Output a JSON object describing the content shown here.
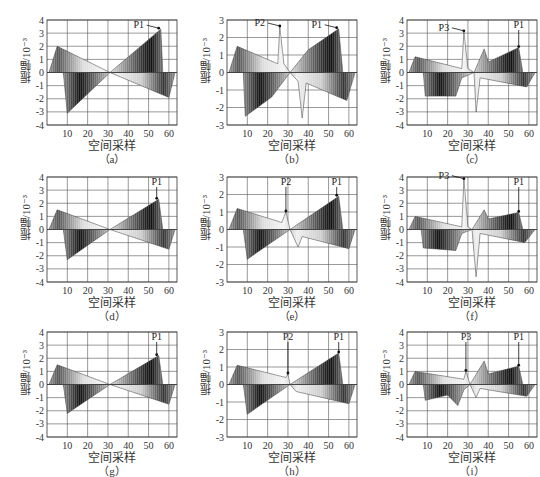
{
  "figure": {
    "ylabel": "振幅/10⁻³",
    "xlabel": "空间采样",
    "x_ticks": [
      10,
      20,
      30,
      40,
      50,
      60
    ]
  },
  "chart_data": [
    {
      "id": "a",
      "type": "area",
      "caption": "（a）",
      "ylim": [
        -4,
        4
      ],
      "y_ticks": [
        4,
        3,
        2,
        1,
        0,
        -1,
        -2,
        -3,
        -4
      ],
      "xlabel": "空间采样",
      "ylabel": "振幅/10⁻³",
      "annotations": [
        {
          "label": "P1",
          "x": 55,
          "y": 3.3
        }
      ],
      "pos_envelope": [
        [
          1,
          0
        ],
        [
          5,
          2.0
        ],
        [
          31,
          0
        ],
        [
          56,
          3.3
        ],
        [
          57,
          0
        ]
      ],
      "neg_envelope": [
        [
          8,
          0
        ],
        [
          10,
          -3.1
        ],
        [
          31,
          0
        ],
        [
          60,
          -1.9
        ],
        [
          63,
          0
        ]
      ]
    },
    {
      "id": "b",
      "type": "area",
      "caption": "（b）",
      "ylim": [
        -3,
        3
      ],
      "y_ticks": [
        3,
        2,
        1,
        0,
        -1,
        -2,
        -3
      ],
      "xlabel": "空间采样",
      "ylabel": "振幅/10⁻³",
      "annotations": [
        {
          "label": "P2",
          "x": 26,
          "y": 2.6
        },
        {
          "label": "P1",
          "x": 54,
          "y": 2.5
        }
      ],
      "pos_envelope": [
        [
          1,
          0
        ],
        [
          5,
          1.5
        ],
        [
          25,
          0.5
        ],
        [
          26,
          2.6
        ],
        [
          28,
          0.5
        ],
        [
          31,
          0
        ],
        [
          40,
          1.3
        ],
        [
          55,
          2.5
        ],
        [
          57,
          0
        ]
      ],
      "neg_envelope": [
        [
          8,
          0
        ],
        [
          9,
          -2.5
        ],
        [
          22,
          -1.4
        ],
        [
          31,
          0
        ],
        [
          35,
          -0.5
        ],
        [
          37,
          -2.6
        ],
        [
          39,
          -0.6
        ],
        [
          59,
          -1.6
        ],
        [
          63,
          0
        ]
      ]
    },
    {
      "id": "c",
      "type": "area",
      "caption": "（c）",
      "ylim": [
        -4,
        4
      ],
      "y_ticks": [
        4,
        3,
        2,
        1,
        0,
        -1,
        -2,
        -3,
        -4
      ],
      "xlabel": "空间采样",
      "ylabel": "振幅/10⁻³",
      "annotations": [
        {
          "label": "P3",
          "x": 28,
          "y": 3.1
        },
        {
          "label": "P1",
          "x": 55,
          "y": 1.9
        }
      ],
      "pos_envelope": [
        [
          1,
          0
        ],
        [
          4,
          1.2
        ],
        [
          27,
          0.3
        ],
        [
          28,
          3.1
        ],
        [
          30,
          0.3
        ],
        [
          33,
          0
        ],
        [
          38,
          1.8
        ],
        [
          40,
          0.8
        ],
        [
          55,
          1.9
        ],
        [
          57,
          0
        ]
      ],
      "neg_envelope": [
        [
          8,
          0
        ],
        [
          9,
          -1.8
        ],
        [
          24,
          -1.8
        ],
        [
          27,
          -0.4
        ],
        [
          33,
          0
        ],
        [
          34,
          -3.0
        ],
        [
          36,
          -0.4
        ],
        [
          59,
          -1.1
        ],
        [
          63,
          0
        ]
      ]
    },
    {
      "id": "d",
      "type": "area",
      "caption": "（d）",
      "ylim": [
        -4,
        4
      ],
      "y_ticks": [
        4,
        3,
        2,
        1,
        0,
        -1,
        -2,
        -3,
        -4
      ],
      "xlabel": "空间采样",
      "ylabel": "振幅/10⁻³",
      "annotations": [
        {
          "label": "P1",
          "x": 54,
          "y": 2.3
        }
      ],
      "pos_envelope": [
        [
          1,
          0
        ],
        [
          5,
          1.5
        ],
        [
          31,
          0
        ],
        [
          55,
          2.3
        ],
        [
          57,
          0
        ]
      ],
      "neg_envelope": [
        [
          8,
          0
        ],
        [
          10,
          -2.3
        ],
        [
          31,
          0
        ],
        [
          60,
          -1.5
        ],
        [
          63,
          0
        ]
      ]
    },
    {
      "id": "e",
      "type": "area",
      "caption": "（e）",
      "ylim": [
        -3,
        3
      ],
      "y_ticks": [
        3,
        2,
        1,
        0,
        -1,
        -2,
        -3
      ],
      "xlabel": "空间采样",
      "ylabel": "振幅/10⁻³",
      "annotations": [
        {
          "label": "P2",
          "x": 29,
          "y": 1.0
        },
        {
          "label": "P1",
          "x": 54,
          "y": 1.9
        }
      ],
      "pos_envelope": [
        [
          1,
          0
        ],
        [
          5,
          1.2
        ],
        [
          27,
          0.4
        ],
        [
          29,
          1.0
        ],
        [
          31,
          0
        ],
        [
          55,
          1.9
        ],
        [
          57,
          0
        ]
      ],
      "neg_envelope": [
        [
          8,
          0
        ],
        [
          10,
          -1.7
        ],
        [
          31,
          0
        ],
        [
          35,
          -1.0
        ],
        [
          37,
          -0.4
        ],
        [
          60,
          -1.1
        ],
        [
          63,
          0
        ]
      ]
    },
    {
      "id": "f",
      "type": "area",
      "caption": "（f）",
      "ylim": [
        -4,
        4
      ],
      "y_ticks": [
        4,
        3,
        2,
        1,
        0,
        -1,
        -2,
        -3,
        -4
      ],
      "xlabel": "空间采样",
      "ylabel": "振幅/10⁻³",
      "annotations": [
        {
          "label": "P3",
          "x": 28,
          "y": 3.8
        },
        {
          "label": "P1",
          "x": 55,
          "y": 1.3
        }
      ],
      "pos_envelope": [
        [
          1,
          0
        ],
        [
          4,
          1.0
        ],
        [
          27,
          0.2
        ],
        [
          28,
          3.8
        ],
        [
          30,
          0.2
        ],
        [
          32,
          0
        ],
        [
          38,
          1.5
        ],
        [
          40,
          0.8
        ],
        [
          55,
          1.3
        ],
        [
          57,
          0
        ]
      ],
      "neg_envelope": [
        [
          7,
          0
        ],
        [
          8,
          -1.4
        ],
        [
          24,
          -1.6
        ],
        [
          27,
          -0.3
        ],
        [
          32,
          0
        ],
        [
          34,
          -3.6
        ],
        [
          36,
          -0.3
        ],
        [
          58,
          -1.0
        ],
        [
          63,
          0
        ]
      ]
    },
    {
      "id": "g",
      "type": "area",
      "caption": "（g）",
      "ylim": [
        -4,
        4
      ],
      "y_ticks": [
        4,
        3,
        2,
        1,
        0,
        -1,
        -2,
        -3,
        -4
      ],
      "xlabel": "空间采样",
      "ylabel": "振幅/10⁻³",
      "annotations": [
        {
          "label": "P1",
          "x": 54,
          "y": 2.2
        }
      ],
      "pos_envelope": [
        [
          1,
          0
        ],
        [
          5,
          1.5
        ],
        [
          31,
          0
        ],
        [
          55,
          2.2
        ],
        [
          57,
          0
        ]
      ],
      "neg_envelope": [
        [
          8,
          0
        ],
        [
          10,
          -2.2
        ],
        [
          31,
          0
        ],
        [
          60,
          -1.5
        ],
        [
          63,
          0
        ]
      ]
    },
    {
      "id": "h",
      "type": "area",
      "caption": "（h）",
      "ylim": [
        -3,
        3
      ],
      "y_ticks": [
        3,
        2,
        1,
        0,
        -1,
        -2,
        -3
      ],
      "xlabel": "空间采样",
      "ylabel": "振幅/10⁻³",
      "annotations": [
        {
          "label": "P2",
          "x": 30,
          "y": 0.6
        },
        {
          "label": "P1",
          "x": 55,
          "y": 1.8
        }
      ],
      "pos_envelope": [
        [
          1,
          0
        ],
        [
          5,
          1.1
        ],
        [
          29,
          0.4
        ],
        [
          30,
          0.6
        ],
        [
          31,
          0
        ],
        [
          55,
          1.8
        ],
        [
          57,
          0
        ]
      ],
      "neg_envelope": [
        [
          8,
          0
        ],
        [
          10,
          -1.7
        ],
        [
          31,
          0
        ],
        [
          34,
          -0.4
        ],
        [
          60,
          -1.1
        ],
        [
          63,
          0
        ]
      ]
    },
    {
      "id": "i",
      "type": "area",
      "caption": "（i）",
      "ylim": [
        -4,
        4
      ],
      "y_ticks": [
        4,
        3,
        2,
        1,
        0,
        -1,
        -2,
        -3,
        -4
      ],
      "xlabel": "空间采样",
      "ylabel": "振幅/10⁻³",
      "annotations": [
        {
          "label": "P3",
          "x": 29,
          "y": 1.0
        },
        {
          "label": "P1",
          "x": 55,
          "y": 1.4
        }
      ],
      "pos_envelope": [
        [
          1,
          0
        ],
        [
          4,
          1.0
        ],
        [
          28,
          0.4
        ],
        [
          29,
          1.0
        ],
        [
          31,
          0
        ],
        [
          38,
          1.8
        ],
        [
          40,
          0.8
        ],
        [
          55,
          1.4
        ],
        [
          57,
          0
        ]
      ],
      "neg_envelope": [
        [
          8,
          0
        ],
        [
          9,
          -1.2
        ],
        [
          20,
          -0.8
        ],
        [
          25,
          -1.6
        ],
        [
          28,
          -0.4
        ],
        [
          31,
          0
        ],
        [
          34,
          -1.0
        ],
        [
          36,
          -0.3
        ],
        [
          59,
          -0.9
        ],
        [
          63,
          0
        ]
      ]
    }
  ]
}
